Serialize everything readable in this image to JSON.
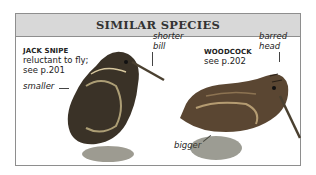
{
  "panel": {
    "title": "SIMILAR SPECIES"
  },
  "species": [
    {
      "name": "JACK SNIPE",
      "note_line1": "reluctant to fly;",
      "note_line2": "see p.201",
      "labels": [
        "smaller",
        "shorter",
        "bill"
      ]
    },
    {
      "name": "WOODCOCK",
      "note_line1": "see p.202",
      "labels": [
        "barred",
        "head",
        "bigger"
      ]
    }
  ],
  "icons": {
    "jack_snipe": "bird-illustration",
    "woodcock": "bird-illustration"
  },
  "colors": {
    "header_bg": "#d8d8d8",
    "border": "#8e8e8e"
  }
}
